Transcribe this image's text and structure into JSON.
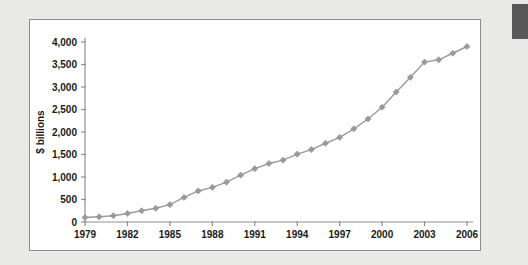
{
  "figure": {
    "panel_name": "chart-figure-panel",
    "background_color": "#ffffff",
    "page_background_color": "#e9e9e7",
    "border_color": "#8c8c8c",
    "corner_marker_color": "#585858"
  },
  "chart_data": {
    "type": "line",
    "title": "",
    "subtitle": "",
    "xlabel": "",
    "ylabel": "$ billions",
    "x": [
      1979,
      1980,
      1981,
      1982,
      1983,
      1984,
      1985,
      1986,
      1987,
      1988,
      1989,
      1990,
      1991,
      1992,
      1993,
      1994,
      1995,
      1996,
      1997,
      1998,
      1999,
      2000,
      2001,
      2002,
      2003,
      2004,
      2005,
      2006
    ],
    "values": [
      100,
      115,
      140,
      190,
      250,
      305,
      385,
      545,
      690,
      770,
      885,
      1040,
      1185,
      1300,
      1375,
      1510,
      1610,
      1750,
      1880,
      2070,
      2290,
      2550,
      2890,
      3215,
      3555,
      3605,
      3750,
      3900
    ],
    "series": [
      {
        "name": "$ billions",
        "values": [
          100,
          115,
          140,
          190,
          250,
          305,
          385,
          545,
          690,
          770,
          885,
          1040,
          1185,
          1300,
          1375,
          1510,
          1610,
          1750,
          1880,
          2070,
          2290,
          2550,
          2890,
          3215,
          3555,
          3605,
          3750,
          3900
        ],
        "line_color": "#9a9a9a",
        "marker_color": "#9a9a9a",
        "marker_shape": "diamond"
      }
    ],
    "xlim": [
      1979,
      2006
    ],
    "ylim": [
      0,
      4000
    ],
    "ytick_values": [
      0,
      500,
      1000,
      1500,
      2000,
      2500,
      3000,
      3500,
      4000
    ],
    "ytick_labels": [
      "0",
      "500",
      "1,000",
      "1,500",
      "2,000",
      "2,500",
      "3,000",
      "3,500",
      "4,000"
    ],
    "xtick_values": [
      1979,
      1982,
      1985,
      1988,
      1991,
      1994,
      1997,
      2000,
      2003,
      2006
    ],
    "xtick_labels": [
      "1979",
      "1982",
      "1985",
      "1988",
      "1991",
      "1994",
      "1997",
      "2000",
      "2003",
      "2006"
    ],
    "grid": false,
    "legend": false,
    "legend_position": "none"
  }
}
